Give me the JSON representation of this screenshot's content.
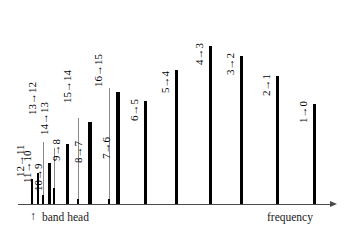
{
  "figure": {
    "type": "spectral-line-diagram",
    "background_color": "#ffffff",
    "line_color": "#000000",
    "axis_color": "#4a4a4a",
    "leader_color": "#8a8a8a"
  },
  "axis": {
    "label_right": "frequency",
    "label_left": "band head",
    "band_head_marker": "↑",
    "arrow_glyph": "▶"
  },
  "chart_data": {
    "type": "bar",
    "title": "",
    "xlabel": "frequency",
    "ylabel": "",
    "grid": false,
    "legend": false,
    "axis_direction": "increasing frequency to the right",
    "annotations": [
      {
        "text": "↑ band head",
        "position": "below-axis-left"
      },
      {
        "text": "frequency",
        "position": "below-axis-right"
      }
    ],
    "categories": [
      "12→11",
      "11→10",
      "10→9",
      "13→12",
      "14→13",
      "9→8",
      "15→14",
      "8→7",
      "16→15",
      "7→6",
      "6→5",
      "5→4",
      "4→3",
      "3→2",
      "2→1",
      "1→0"
    ],
    "values": [
      25,
      31,
      41,
      9,
      16,
      60,
      5,
      82,
      5,
      112,
      103,
      134,
      158,
      148,
      128,
      100
    ],
    "ylim": [
      0,
      175
    ],
    "bars": [
      {
        "label": "12→11",
        "x": 31,
        "height": 25,
        "width": 2.4,
        "leader": 0,
        "label_y": 166,
        "label_x": 26
      },
      {
        "label": "11→10",
        "x": 37,
        "height": 31,
        "width": 2.4,
        "leader": 0,
        "label_y": 172,
        "label_x": 33
      },
      {
        "label": "10→9",
        "x": 48,
        "height": 41,
        "width": 3.0,
        "leader": 0,
        "label_y": 180,
        "label_x": 44
      },
      {
        "label": "13→12",
        "x": 42,
        "height": 9,
        "width": 2.0,
        "leader": 62,
        "label_y": 104,
        "label_x": 38
      },
      {
        "label": "14→13",
        "x": 53,
        "height": 16,
        "width": 2.0,
        "leader": 56,
        "label_y": 124,
        "label_x": 50
      },
      {
        "label": "9→8",
        "x": 66,
        "height": 60,
        "width": 3.2,
        "leader": 0,
        "label_y": 150,
        "label_x": 62
      },
      {
        "label": "15→14",
        "x": 77,
        "height": 5,
        "width": 2.0,
        "leader": 86,
        "label_y": 92,
        "label_x": 73
      },
      {
        "label": "8→7",
        "x": 88,
        "height": 82,
        "width": 3.6,
        "leader": 0,
        "label_y": 152,
        "label_x": 84
      },
      {
        "label": "16→15",
        "x": 108,
        "height": 5,
        "width": 2.0,
        "leader": 116,
        "label_y": 76,
        "label_x": 104
      },
      {
        "label": "7→6",
        "x": 116,
        "height": 112,
        "width": 3.8,
        "leader": 0,
        "label_y": 148,
        "label_x": 112
      },
      {
        "label": "6→5",
        "x": 144,
        "height": 103,
        "width": 3.0,
        "leader": 0,
        "label_y": 110,
        "label_x": 140
      },
      {
        "label": "5→4",
        "x": 175,
        "height": 134,
        "width": 3.0,
        "leader": 0,
        "label_y": 82,
        "label_x": 171
      },
      {
        "label": "4→3",
        "x": 209,
        "height": 158,
        "width": 3.4,
        "leader": 0,
        "label_y": 54,
        "label_x": 205
      },
      {
        "label": "3→2",
        "x": 240,
        "height": 148,
        "width": 3.4,
        "leader": 0,
        "label_y": 64,
        "label_x": 236
      },
      {
        "label": "2→1",
        "x": 276,
        "height": 128,
        "width": 3.0,
        "leader": 0,
        "label_y": 85,
        "label_x": 272
      },
      {
        "label": "1→0",
        "x": 313,
        "height": 100,
        "width": 3.0,
        "leader": 0,
        "label_y": 112,
        "label_x": 309
      }
    ]
  }
}
